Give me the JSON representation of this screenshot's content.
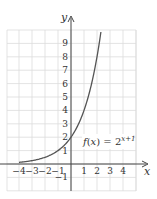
{
  "chart_data": {
    "type": "line",
    "title": "",
    "xlabel": "x",
    "ylabel": "y",
    "xlim": [
      -4.9,
      5
    ],
    "ylim": [
      -2,
      10
    ],
    "grid": true,
    "x_ticks": [
      "-4",
      "-3",
      "-2",
      "-1",
      "1",
      "2",
      "3",
      "4"
    ],
    "y_ticks": [
      "-1",
      "1",
      "2",
      "3",
      "4",
      "5",
      "6",
      "7",
      "8",
      "9"
    ],
    "series": [
      {
        "name": "f(x) = 2^(x+1)",
        "equation": "f(x) = 2^(x+1)",
        "x": [
          -4,
          -3,
          -2,
          -1,
          0,
          1,
          2,
          2.3
        ],
        "values": [
          0.125,
          0.25,
          0.5,
          1,
          2,
          4,
          8,
          9.85
        ]
      }
    ],
    "annotations": [
      {
        "text_main": "f(x) = 2",
        "text_sup": "x+1",
        "x": 1.5,
        "y": 1.5
      }
    ]
  }
}
